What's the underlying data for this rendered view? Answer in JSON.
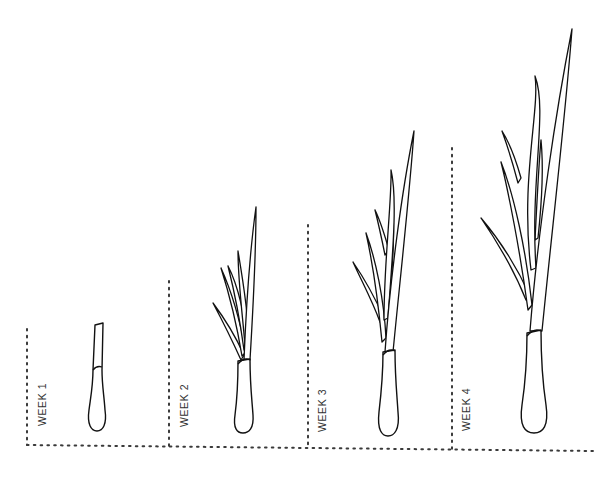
{
  "diagram": {
    "title": "",
    "stages": [
      {
        "label": "WEEK 1",
        "leaf_count": 0
      },
      {
        "label": "WEEK 2",
        "leaf_count": 5
      },
      {
        "label": "WEEK 3",
        "leaf_count": 6
      },
      {
        "label": "WEEK 4",
        "leaf_count": 6
      }
    ]
  },
  "colors": {
    "line": "#111111",
    "dotted_line": "#3a3a3a",
    "label_text": "#333333",
    "background": "#ffffff"
  }
}
